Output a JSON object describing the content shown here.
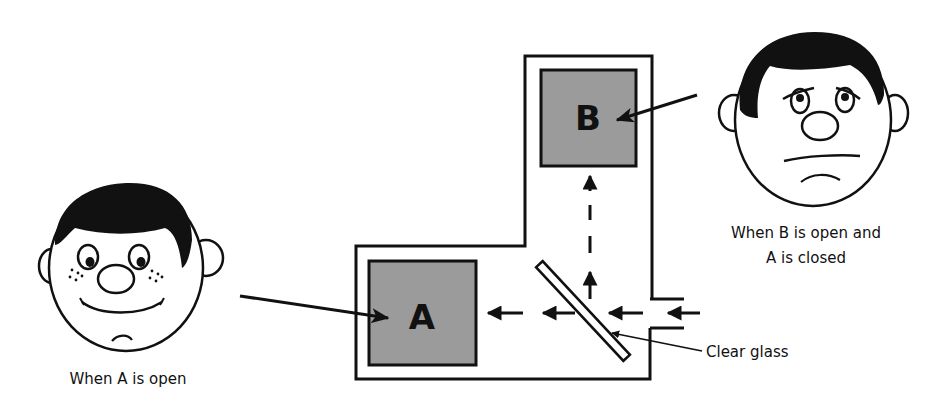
{
  "diagram": {
    "boxes": [
      {
        "id": "A",
        "label": "A"
      },
      {
        "id": "B",
        "label": "B"
      }
    ],
    "captions": {
      "happy_face": "When A is open",
      "sad_face_line1": "When B is open and",
      "sad_face_line2": "A is closed",
      "glass": "Clear glass"
    },
    "colors": {
      "box_fill": "#9b9b9b",
      "ink": "#111111",
      "background": "#ffffff"
    },
    "faces": [
      {
        "id": "happy",
        "expression": "smiling",
        "looks_at": "A"
      },
      {
        "id": "sad",
        "expression": "sad",
        "looks_at": "B"
      }
    ],
    "light_paths": [
      {
        "from": "entrance",
        "to": "A",
        "through": "glass"
      },
      {
        "from": "glass",
        "to": "B",
        "reflected": true
      }
    ]
  }
}
